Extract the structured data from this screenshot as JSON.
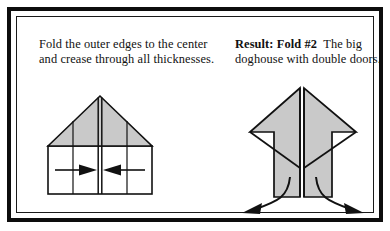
{
  "panel": {
    "border_color": "#0d0d0d",
    "background": "#ffffff"
  },
  "instructions": {
    "left": {
      "text": "Fold the outer edges to the center and crease through all thicknesses."
    },
    "right": {
      "lead": "Result: Fold #2",
      "text": "The big doghouse with double doors."
    }
  },
  "diagrams": {
    "left": {
      "name": "house-shape-with-fold-arrows",
      "paper_fill": "#ffffff",
      "roof_fill": "#c9c9c9",
      "stroke": "#111111",
      "arrows": [
        {
          "name": "fold-arrow-right",
          "direction": "right"
        },
        {
          "name": "fold-arrow-left",
          "direction": "left"
        }
      ]
    },
    "right": {
      "name": "doghouse-with-double-doors",
      "paper_fill": "#c9c9c9",
      "stroke": "#111111",
      "arrows": [
        {
          "name": "door-open-arrow-left",
          "direction": "down-left"
        },
        {
          "name": "door-open-arrow-right",
          "direction": "down-right"
        }
      ]
    }
  }
}
